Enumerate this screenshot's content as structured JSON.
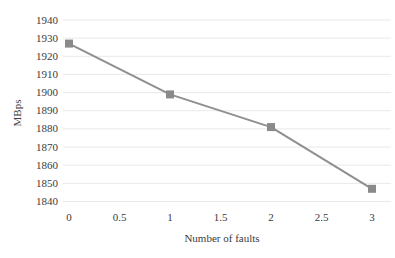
{
  "chart_data": {
    "type": "line",
    "title": "",
    "xlabel": "Number of faults",
    "ylabel": "MBps",
    "x": [
      0,
      1,
      2,
      3
    ],
    "values": [
      1927,
      1899,
      1881,
      1847
    ],
    "series_name": "throughput",
    "xticks": [
      0,
      0.5,
      1,
      1.5,
      2,
      2.5,
      3
    ],
    "xtick_labels": [
      "0",
      "0.5",
      "1",
      "1.5",
      "2",
      "2.5",
      "3"
    ],
    "yticks": [
      1840,
      1850,
      1860,
      1870,
      1880,
      1890,
      1900,
      1910,
      1920,
      1930,
      1940
    ],
    "ytick_labels": [
      "1840",
      "1850",
      "1860",
      "1870",
      "1880",
      "1890",
      "1900",
      "1910",
      "1920",
      "1930",
      "1940"
    ],
    "xlim": [
      0,
      3
    ],
    "ylim": [
      1840,
      1940
    ],
    "grid": "horizontal",
    "legend": "none",
    "marker": "square",
    "colors": {
      "line": "#8f8f8f",
      "marker": "#8a8a8a",
      "grid": "#e9e9e9",
      "text": "#3b3b3b",
      "background": "#ffffff"
    }
  }
}
